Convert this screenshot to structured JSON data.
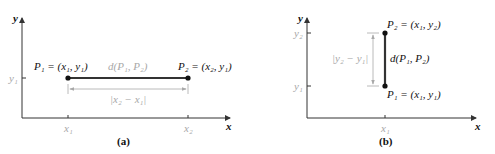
{
  "panel_a": {
    "caption": "(a)",
    "axis_x_label": "x",
    "axis_y_label": "y",
    "tick_y": "y₁",
    "tick_x1": "x₁",
    "tick_x2": "x₂",
    "p1_label": "P₁ = (x₁, y₁)",
    "p2_label": "P₂ = (x₂, y₁)",
    "distance_label": "d(P₁, P₂)",
    "abs_label": "|x₂ − x₁|"
  },
  "panel_b": {
    "caption": "(b)",
    "axis_x_label": "x",
    "axis_y_label": "y",
    "tick_y1": "y₁",
    "tick_y2": "y₂",
    "tick_x1": "x₁",
    "p1_label": "P₁ = (x₁, y₁)",
    "p2_label": "P₂ = (x₁, y₂)",
    "distance_label": "d(P₁, P₂)",
    "abs_label": "|y₂ − y₁|"
  },
  "colors": {
    "segment": "#333333",
    "dimension": "#a8a8a8",
    "axis": "#333333"
  }
}
